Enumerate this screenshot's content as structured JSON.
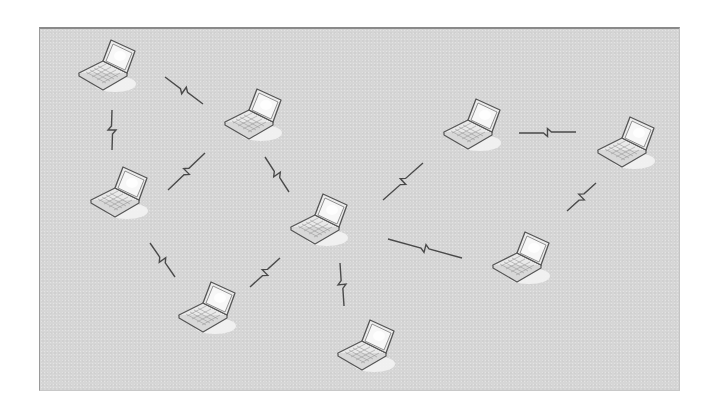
{
  "diagram": {
    "type": "wireless ad-hoc network",
    "node_count": 9,
    "link_count": 11,
    "colors": {
      "background": "#ffffff",
      "panel": "#d6d6d6",
      "panel_border": "#8a8a8a",
      "link": "#4a4a4a",
      "laptop_outline": "#555555",
      "laptop_body": "#e8e8e8",
      "laptop_screen": "#f4f4f4",
      "halo": "#f2f2f2"
    },
    "nodes": [
      {
        "id": "L1",
        "icon": "laptop-icon",
        "x": 75,
        "y": 37
      },
      {
        "id": "L2",
        "icon": "laptop-icon",
        "x": 221,
        "y": 86
      },
      {
        "id": "L3",
        "icon": "laptop-icon",
        "x": 87,
        "y": 164
      },
      {
        "id": "L4",
        "icon": "laptop-icon",
        "x": 287,
        "y": 191
      },
      {
        "id": "L5",
        "icon": "laptop-icon",
        "x": 440,
        "y": 96
      },
      {
        "id": "L6",
        "icon": "laptop-icon",
        "x": 594,
        "y": 114
      },
      {
        "id": "L7",
        "icon": "laptop-icon",
        "x": 489,
        "y": 229
      },
      {
        "id": "L8",
        "icon": "laptop-icon",
        "x": 175,
        "y": 279
      },
      {
        "id": "L9",
        "icon": "laptop-icon",
        "x": 334,
        "y": 317
      }
    ],
    "links": [
      {
        "from": "L1",
        "to": "L2",
        "icon": "wireless-bolt-icon",
        "x1": 165,
        "y1": 77,
        "x2": 203,
        "y2": 104
      },
      {
        "from": "L1",
        "to": "L3",
        "icon": "wireless-bolt-icon",
        "x1": 112,
        "y1": 110,
        "x2": 112,
        "y2": 150
      },
      {
        "from": "L2",
        "to": "L3",
        "icon": "wireless-bolt-icon",
        "x1": 168,
        "y1": 190,
        "x2": 205,
        "y2": 153
      },
      {
        "from": "L2",
        "to": "L4",
        "icon": "wireless-bolt-icon",
        "x1": 265,
        "y1": 157,
        "x2": 289,
        "y2": 192
      },
      {
        "from": "L3",
        "to": "L8",
        "icon": "wireless-bolt-icon",
        "x1": 150,
        "y1": 243,
        "x2": 175,
        "y2": 277
      },
      {
        "from": "L4",
        "to": "L8",
        "icon": "wireless-bolt-icon",
        "x1": 250,
        "y1": 287,
        "x2": 280,
        "y2": 258
      },
      {
        "from": "L4",
        "to": "L9",
        "icon": "wireless-bolt-icon",
        "x1": 340,
        "y1": 263,
        "x2": 344,
        "y2": 306
      },
      {
        "from": "L4",
        "to": "L5",
        "icon": "wireless-bolt-icon",
        "x1": 383,
        "y1": 200,
        "x2": 423,
        "y2": 163
      },
      {
        "from": "L4",
        "to": "L7",
        "icon": "wireless-bolt-icon",
        "x1": 388,
        "y1": 239,
        "x2": 462,
        "y2": 258
      },
      {
        "from": "L5",
        "to": "L6",
        "icon": "wireless-bolt-icon",
        "x1": 519,
        "y1": 133,
        "x2": 576,
        "y2": 132
      },
      {
        "from": "L6",
        "to": "L7",
        "icon": "wireless-bolt-icon",
        "x1": 567,
        "y1": 211,
        "x2": 596,
        "y2": 183
      }
    ]
  }
}
